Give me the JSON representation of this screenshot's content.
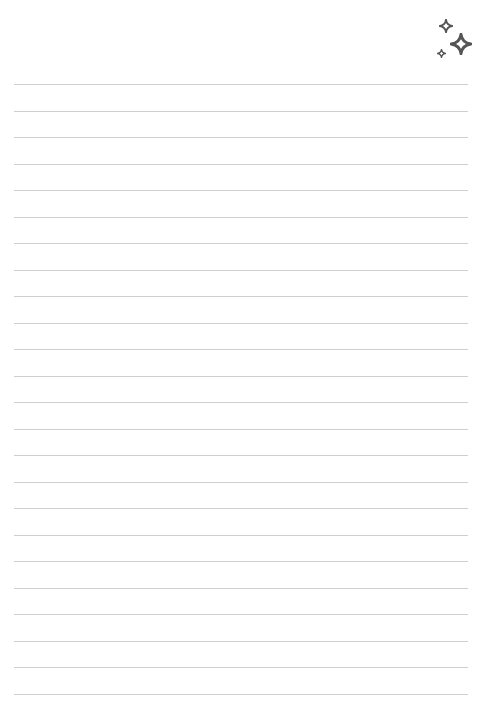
{
  "page": {
    "type": "lined-paper",
    "background": "#ffffff",
    "line_color": "#cfcfcf",
    "line_count": 24,
    "first_line_y": 84,
    "line_spacing": 26.5,
    "line_left": 14,
    "line_width": 454
  },
  "decoration": {
    "icon": "sparkles-icon",
    "color": "#555555",
    "stars": [
      {
        "name": "medium-star",
        "x": 446,
        "y": 26,
        "size": 14
      },
      {
        "name": "large-star",
        "x": 461,
        "y": 44,
        "size": 22
      },
      {
        "name": "small-star",
        "x": 442,
        "y": 53,
        "size": 9
      }
    ]
  }
}
